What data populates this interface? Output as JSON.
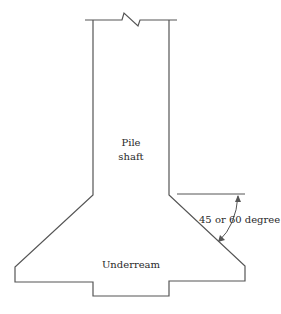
{
  "diagram": {
    "labels": {
      "shaft_line1": "Pile",
      "shaft_line2": "shaft",
      "underream": "Underream",
      "angle": "45 or 60 degree"
    },
    "colors": {
      "stroke": "#555555",
      "text": "#2a2a2a",
      "background": "#ffffff"
    }
  }
}
